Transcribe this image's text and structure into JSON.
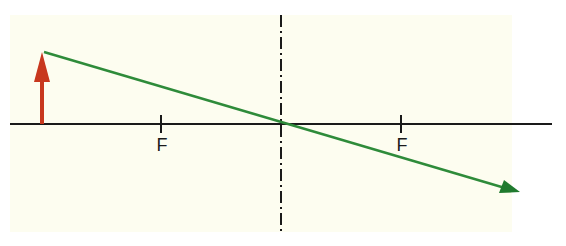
{
  "diagram": {
    "type": "ray-diagram-thin-lens",
    "canvas": {
      "width": 566,
      "height": 246
    },
    "colors": {
      "background": "#ffffff",
      "panel": "#fdfdf0",
      "axis": "#1a1a1a",
      "lens_line": "#1a1a1a",
      "object_arrow": "#c8381e",
      "ray": "#2e8b3a"
    },
    "optical_axis": {
      "x1": 10,
      "x2": 552,
      "y": 124
    },
    "lens": {
      "x": 281,
      "y1": 15,
      "y2": 232,
      "style": "dash-dot"
    },
    "object": {
      "x": 42,
      "base_y": 124,
      "tip_y": 52
    },
    "focal_points": [
      {
        "label": "F",
        "x": 161,
        "label_y": 136
      },
      {
        "label": "F",
        "x": 401,
        "label_y": 136
      }
    ],
    "ray": {
      "start": {
        "x": 44,
        "y": 52
      },
      "through": {
        "x": 281,
        "y": 124
      },
      "end": {
        "x": 520,
        "y": 192
      }
    }
  }
}
